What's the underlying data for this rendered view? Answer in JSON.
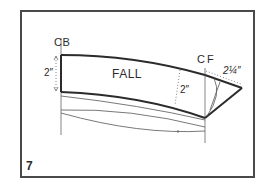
{
  "figure": {
    "number": "7",
    "labels": {
      "center_back": "CB",
      "center_front": "CF",
      "fall": "FALL",
      "measure_left": "2″",
      "measure_mid": "2″",
      "measure_tip": "2¼″"
    },
    "colors": {
      "frame": "#4a4a4a",
      "heavy_line": "#2b2b2b",
      "thin_line": "#555555",
      "background": "#ffffff"
    }
  }
}
